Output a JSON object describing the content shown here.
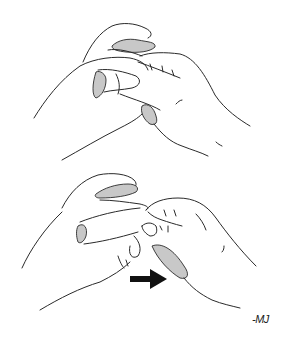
{
  "illustration": {
    "panels": [
      {
        "id": "top",
        "description": "two hands holding a fold of tissue between fingers"
      },
      {
        "id": "bottom",
        "description": "hands pulling tissue apart, arrow indicating direction"
      }
    ],
    "arrow": {
      "direction": "right",
      "color": "#111111"
    },
    "shade_color": "#c8c8c8",
    "line_color": "#2a2a2a",
    "signature": "-MJ"
  }
}
